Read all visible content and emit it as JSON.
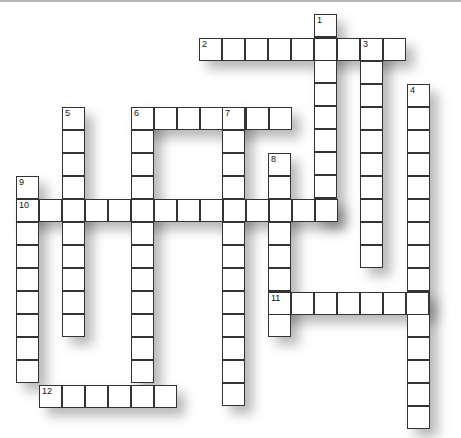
{
  "puzzle": {
    "type": "crossword",
    "cell_size": 23,
    "words": [
      {
        "number": "1",
        "direction": "down",
        "x": 314,
        "y": 14,
        "length": 9
      },
      {
        "number": "2",
        "direction": "across",
        "x": 199,
        "y": 38,
        "length": 9
      },
      {
        "number": "3",
        "direction": "down",
        "x": 360,
        "y": 38,
        "length": 10
      },
      {
        "number": "4",
        "direction": "down",
        "x": 407,
        "y": 84,
        "length": 15
      },
      {
        "number": "5",
        "direction": "down",
        "x": 62,
        "y": 107,
        "length": 10
      },
      {
        "number": "6",
        "direction": "across",
        "x": 131,
        "y": 107,
        "length": 7
      },
      {
        "number": "",
        "direction": "down",
        "x": 131,
        "y": 107,
        "length": 12
      },
      {
        "number": "7",
        "direction": "down",
        "x": 222,
        "y": 107,
        "length": 13
      },
      {
        "number": "8",
        "direction": "down",
        "x": 268,
        "y": 153,
        "length": 8
      },
      {
        "number": "9",
        "direction": "down",
        "x": 16,
        "y": 176,
        "length": 9
      },
      {
        "number": "10",
        "direction": "across",
        "x": 16,
        "y": 199,
        "length": 14
      },
      {
        "number": "11",
        "direction": "across",
        "x": 268,
        "y": 292,
        "length": 7
      },
      {
        "number": "12",
        "direction": "across",
        "x": 39,
        "y": 385,
        "length": 6
      }
    ]
  }
}
